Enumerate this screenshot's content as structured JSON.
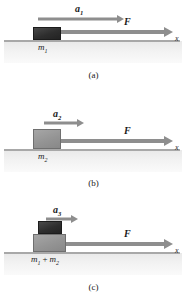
{
  "figure": {
    "type": "physics-free-body-diagram",
    "axis_label": "x"
  },
  "colors": {
    "block_dark": "#2e2e2e",
    "block_gray": "#949494",
    "arrow": "#8e8e8e",
    "ground_line": "#a8a8a8",
    "ground_shade": "#eeeeee",
    "text": "#1a1a1a"
  },
  "panels": [
    {
      "caption": "(a)",
      "acceleration_label": "a",
      "acceleration_sub": "1",
      "force_label": "F",
      "mass_label": "m",
      "mass_sub": "1",
      "axis_label": "x",
      "blocks": [
        {
          "name": "m1",
          "shade": "dark"
        }
      ]
    },
    {
      "caption": "(b)",
      "acceleration_label": "a",
      "acceleration_sub": "2",
      "force_label": "F",
      "mass_label": "m",
      "mass_sub": "2",
      "axis_label": "x",
      "blocks": [
        {
          "name": "m2",
          "shade": "gray"
        }
      ]
    },
    {
      "caption": "(c)",
      "acceleration_label": "a",
      "acceleration_sub": "3",
      "force_label": "F",
      "mass_label_full": "m₁ + m₂",
      "mass_label_a": "m",
      "mass_sub_a": "1",
      "mass_plus": "+",
      "mass_label_b": "m",
      "mass_sub_b": "2",
      "axis_label": "x",
      "blocks": [
        {
          "name": "m1",
          "shade": "dark"
        },
        {
          "name": "m2",
          "shade": "gray"
        }
      ]
    }
  ]
}
